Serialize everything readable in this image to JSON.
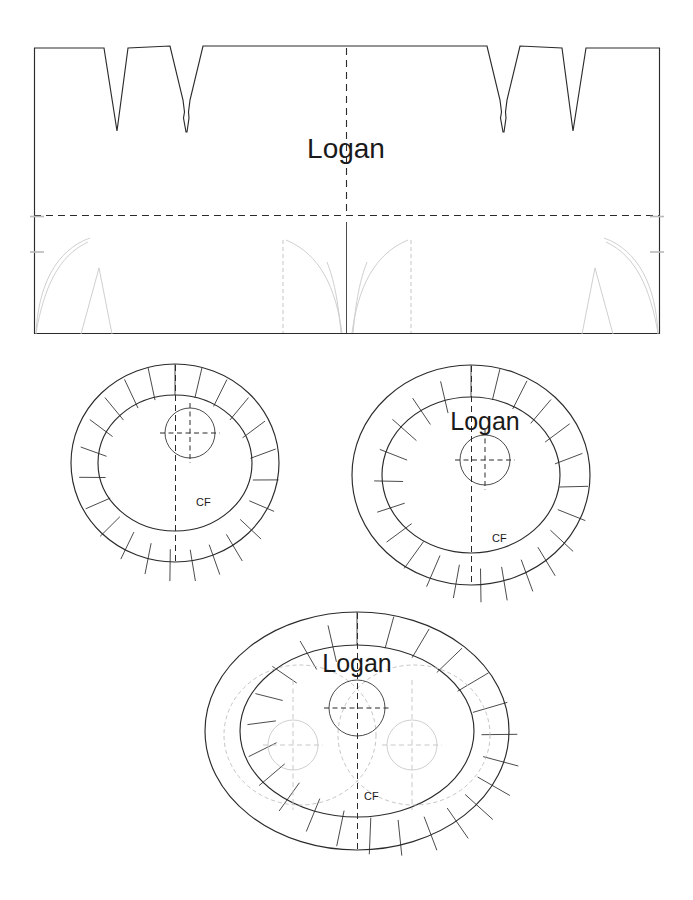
{
  "document": {
    "kind": "sewing-pattern-sheet",
    "pattern_name": "Logan",
    "page_width": 693,
    "page_height": 900,
    "background_color": "#ffffff",
    "ink_color": "#2b2b2b",
    "ghost_color": "#c9c9c9"
  },
  "pieces": [
    {
      "id": "side-band",
      "name": "Logan",
      "shape": "rectangle-with-darts",
      "title_label": "Logan",
      "has_center_fold_vertical": true,
      "has_horizontal_fold": true,
      "dart_count_top": 4,
      "ghost_dart_count_bottom": 2,
      "bounds": {
        "x": 34,
        "y": 48,
        "width": 626,
        "height": 286
      }
    },
    {
      "id": "base-small",
      "name": "base small oval",
      "shape": "oval-with-seam-notches",
      "title_label": "",
      "cf_label": "CF",
      "notch_count": 24,
      "has_grain_circle": true,
      "bounds": {
        "x": 70,
        "y": 363,
        "width": 210,
        "height": 200
      }
    },
    {
      "id": "base-large",
      "name": "Logan base large oval",
      "shape": "oval-with-seam-notches",
      "title_label": "Logan",
      "cf_label": "CF",
      "notch_count": 26,
      "has_grain_circle": true,
      "bounds": {
        "x": 352,
        "y": 365,
        "width": 238,
        "height": 220
      }
    },
    {
      "id": "base-double",
      "name": "Logan double base oval",
      "shape": "oval-with-seam-notches",
      "title_label": "Logan",
      "cf_label": "CF",
      "notch_count": 26,
      "has_grain_circle": true,
      "ghost_overlay_circles": 2,
      "bounds": {
        "x": 205,
        "y": 612,
        "width": 305,
        "height": 238
      }
    }
  ],
  "labels": {
    "title_top": "Logan",
    "title_large_oval": "Logan",
    "title_double_oval": "Logan",
    "cf_small": "CF",
    "cf_large": "CF",
    "cf_double": "CF"
  }
}
